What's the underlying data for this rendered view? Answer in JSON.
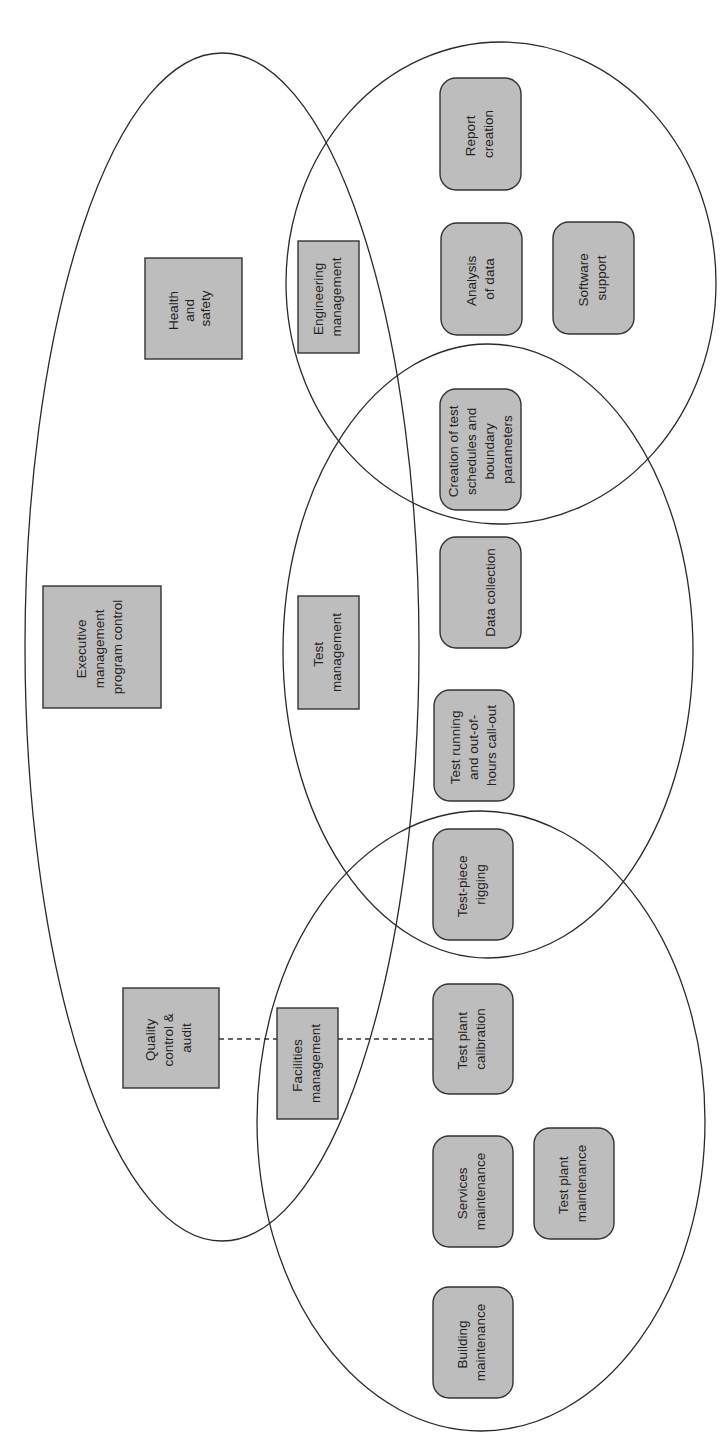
{
  "diagram": {
    "orientation": "rotated-90-ccw",
    "colors": {
      "box_fill": "#bdbdbd",
      "stroke": "#2a2a2a",
      "background": "#ffffff"
    },
    "groups": [
      {
        "id": "executive",
        "ellipse": {
          "cx": 222,
          "cy": 647,
          "rx": 197,
          "ry": 594
        }
      },
      {
        "id": "engineering",
        "ellipse": {
          "cx": 501,
          "cy": 283,
          "rx": 215,
          "ry": 241
        }
      },
      {
        "id": "test",
        "ellipse": {
          "cx": 488,
          "cy": 651,
          "rx": 205,
          "ry": 307
        }
      },
      {
        "id": "facilities",
        "ellipse": {
          "cx": 481,
          "cy": 1121,
          "rx": 224,
          "ry": 310
        }
      }
    ],
    "managers": {
      "health": {
        "lines": [
          "Health",
          "and",
          "safety"
        ]
      },
      "executive": {
        "lines": [
          "Executive",
          "management",
          "program control"
        ]
      },
      "quality": {
        "lines": [
          "Quality",
          "control &",
          "audit"
        ]
      },
      "engineering": {
        "lines": [
          "Engineering",
          "management"
        ]
      },
      "test": {
        "lines": [
          "Test",
          "management"
        ]
      },
      "facilities": {
        "lines": [
          "Facilities",
          "management"
        ]
      }
    },
    "tasks": {
      "report": {
        "lines": [
          "Report",
          "creation"
        ]
      },
      "analysis": {
        "lines": [
          "Analysis",
          "of data"
        ]
      },
      "software": {
        "lines": [
          "Software",
          "support"
        ]
      },
      "creation": {
        "lines": [
          "Creation of test",
          "schedules and",
          "boundary",
          "parameters"
        ]
      },
      "data_collection": {
        "lines": [
          "Data collection"
        ]
      },
      "test_running": {
        "lines": [
          "Test running",
          "and out-of-",
          "hours call-out"
        ]
      },
      "rigging": {
        "lines": [
          "Test-piece",
          "rigging"
        ]
      },
      "calibration": {
        "lines": [
          "Test plant",
          "calibration"
        ]
      },
      "services": {
        "lines": [
          "Services",
          "maintenance"
        ]
      },
      "plant_maintenance": {
        "lines": [
          "Test plant",
          "maintenance"
        ]
      },
      "building": {
        "lines": [
          "Building",
          "maintenance"
        ]
      }
    },
    "connectors": [
      {
        "type": "dashed",
        "from": "quality",
        "via": "facilities",
        "to": "calibration"
      }
    ]
  }
}
